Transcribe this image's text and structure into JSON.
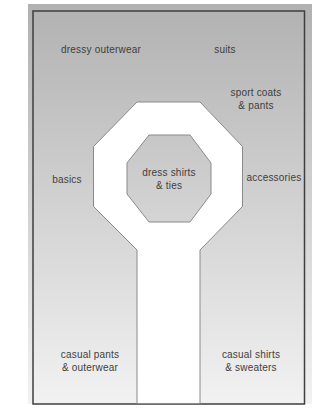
{
  "diagram": {
    "kind": "store-floor-plan",
    "zones": {
      "dressy_outerwear": {
        "lines": [
          "dressy outerwear"
        ]
      },
      "suits": {
        "lines": [
          "suits"
        ]
      },
      "sport_coats_pants": {
        "lines": [
          "sport coats",
          "& pants"
        ]
      },
      "basics": {
        "lines": [
          "basics"
        ]
      },
      "dress_shirts_ties": {
        "lines": [
          "dress shirts",
          "& ties"
        ]
      },
      "accessories": {
        "lines": [
          "accessories"
        ]
      },
      "casual_pants_outerwear": {
        "lines": [
          "casual pants",
          "& outerwear"
        ]
      },
      "casual_shirts_sweaters": {
        "lines": [
          "casual shirts",
          "& sweaters"
        ]
      }
    }
  },
  "colors": {
    "panel_top": "#b1b1b1",
    "panel_bottom": "#f2f2f2",
    "path_fill": "#ffffff",
    "outline": "#8a8a8a",
    "border": "#3f3f3f",
    "text": "#3e3e3e"
  }
}
